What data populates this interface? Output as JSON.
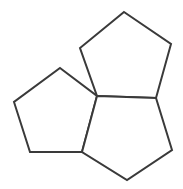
{
  "figure": {
    "name": "pentagon-cluster",
    "background_color": "#ffffff",
    "stroke_color": "#3a3a3a",
    "fill_color": "#ffffff",
    "stroke_width": 2,
    "canvas": {
      "width": 183,
      "height": 189
    },
    "shared_vertex": {
      "label": "central-junction",
      "x": 97,
      "y": 96
    },
    "shapes": [
      {
        "name": "pentagon-top",
        "sides": 5,
        "points": "124,12 171,44 156,98 97,96 80,48",
        "vertices": [
          {
            "label": "apex",
            "x": 124,
            "y": 12
          },
          {
            "label": "upper-right",
            "x": 171,
            "y": 44
          },
          {
            "label": "lower-right-junction",
            "x": 156,
            "y": 98
          },
          {
            "label": "central-junction",
            "x": 97,
            "y": 96
          },
          {
            "label": "upper-left",
            "x": 80,
            "y": 48
          }
        ]
      },
      {
        "name": "pentagon-left",
        "sides": 5,
        "points": "60,68 97,96 82,152 30,152 14,102",
        "vertices": [
          {
            "label": "apex",
            "x": 60,
            "y": 68
          },
          {
            "label": "central-junction",
            "x": 97,
            "y": 96
          },
          {
            "label": "lower-right-junction",
            "x": 82,
            "y": 152
          },
          {
            "label": "lower-left",
            "x": 30,
            "y": 152
          },
          {
            "label": "mid-left",
            "x": 14,
            "y": 102
          }
        ]
      },
      {
        "name": "pentagon-bottom-right",
        "sides": 5,
        "points": "97,96 156,98 172,150 127,180 82,152",
        "vertices": [
          {
            "label": "central-junction",
            "x": 97,
            "y": 96
          },
          {
            "label": "upper-right-junction",
            "x": 156,
            "y": 98
          },
          {
            "label": "mid-right",
            "x": 172,
            "y": 150
          },
          {
            "label": "bottom-apex",
            "x": 127,
            "y": 180
          },
          {
            "label": "lower-left-junction",
            "x": 82,
            "y": 152
          }
        ]
      }
    ]
  }
}
